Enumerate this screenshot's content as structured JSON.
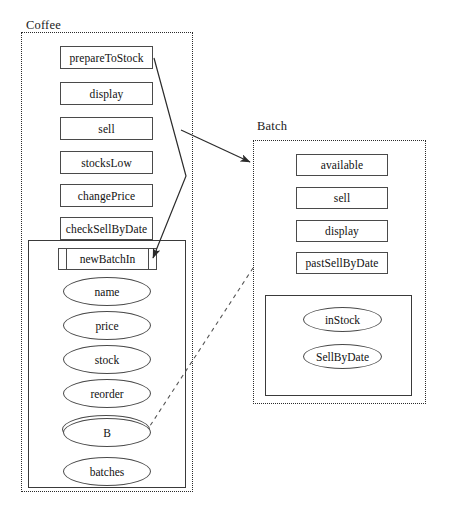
{
  "diagram": {
    "type": "uml-class-diagram",
    "canvas": {
      "width": 450,
      "height": 514
    },
    "colors": {
      "background": "#ffffff",
      "stroke": "#4a4a4a",
      "package_border": "#2b2b2b",
      "text": "#111111"
    }
  },
  "packages": [
    {
      "id": "coffee",
      "label": "Coffee",
      "label_pos": {
        "x": 26,
        "y": 18
      },
      "box": {
        "x": 21,
        "y": 32,
        "w": 172,
        "h": 460
      },
      "methods": [
        {
          "label": "prepareToStock",
          "x": 60,
          "y": 46,
          "w": 93,
          "h": 23
        },
        {
          "label": "display",
          "x": 60,
          "y": 82,
          "w": 93,
          "h": 23
        },
        {
          "label": "sell",
          "x": 60,
          "y": 117,
          "w": 93,
          "h": 23
        },
        {
          "label": "stocksLow",
          "x": 60,
          "y": 151,
          "w": 93,
          "h": 23
        },
        {
          "label": "changePrice",
          "x": 60,
          "y": 184,
          "w": 93,
          "h": 23
        },
        {
          "label": "checkSellByDate",
          "x": 60,
          "y": 217,
          "w": 93,
          "h": 23
        }
      ],
      "attribute_box": {
        "x": 28,
        "y": 240,
        "w": 158,
        "h": 248
      },
      "compartment": {
        "label": "newBatchIn",
        "x": 58,
        "y": 248,
        "w": 99,
        "h": 22
      },
      "attributes": [
        {
          "label": "name",
          "x": 63,
          "y": 277,
          "w": 88,
          "h": 29
        },
        {
          "label": "price",
          "x": 63,
          "y": 311,
          "w": 88,
          "h": 29
        },
        {
          "label": "stock",
          "x": 63,
          "y": 345,
          "w": 88,
          "h": 29
        },
        {
          "label": "reorder",
          "x": 63,
          "y": 379,
          "w": 88,
          "h": 29
        },
        {
          "label": "B",
          "x": 63,
          "y": 418,
          "w": 88,
          "h": 29
        },
        {
          "label": "batches",
          "x": 63,
          "y": 457,
          "w": 88,
          "h": 29
        }
      ],
      "ghost_ellipse": {
        "x": 62,
        "y": 415,
        "w": 88,
        "h": 29
      }
    },
    {
      "id": "batch",
      "label": "Batch",
      "label_pos": {
        "x": 257,
        "y": 119
      },
      "box": {
        "x": 253,
        "y": 140,
        "w": 173,
        "h": 264
      },
      "methods": [
        {
          "label": "available",
          "x": 296,
          "y": 154,
          "w": 92,
          "h": 22
        },
        {
          "label": "sell",
          "x": 296,
          "y": 187,
          "w": 92,
          "h": 22
        },
        {
          "label": "display",
          "x": 296,
          "y": 220,
          "w": 92,
          "h": 22
        },
        {
          "label": "pastSellByDate",
          "x": 296,
          "y": 252,
          "w": 92,
          "h": 22
        }
      ],
      "attribute_box": {
        "x": 265,
        "y": 295,
        "w": 147,
        "h": 101
      },
      "attributes": [
        {
          "label": "inStock",
          "x": 303,
          "y": 307,
          "w": 79,
          "h": 25
        },
        {
          "label": "SellByDate",
          "x": 303,
          "y": 344,
          "w": 79,
          "h": 25
        }
      ]
    }
  ],
  "connectors": [
    {
      "id": "prepare-to-newbatch",
      "kind": "solid-polyline-arrow",
      "points": "154,58 186,176 152,259",
      "arrow_at": "152,259",
      "description": "prepareToStock to newBatchIn"
    },
    {
      "id": "coffee-to-batch",
      "kind": "solid-arrow",
      "points": "181,130 251,163",
      "arrow_at": "251,163",
      "description": "Coffee package to Batch package"
    },
    {
      "id": "b-to-batch",
      "kind": "dashed-line",
      "points": "146,432 253,268",
      "description": "B attribute to Batch package"
    }
  ]
}
